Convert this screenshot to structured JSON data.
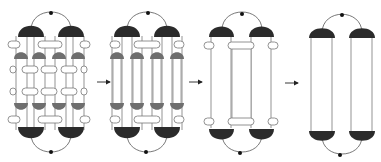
{
  "diagram": {
    "title": "",
    "colors": {
      "dark_cap": "#2b2b2b",
      "mid_cap": "#6e6e6e",
      "line": "#555555",
      "pill_stroke": "#777777",
      "pill_fill": "#ffffff",
      "dot": "#111111",
      "arrow": "#222222",
      "background": "#ffffff"
    },
    "panels": [
      {
        "id": "stage-1",
        "label": "",
        "description": "Two dark outer caps per end, four gray inner caps per row, multiple pill cross-links"
      },
      {
        "id": "stage-2",
        "label": "",
        "description": "Four long vertical columns with gray caps, pill links near ends"
      },
      {
        "id": "stage-3",
        "label": "",
        "description": "Three columns, dark caps, pill links near ends"
      },
      {
        "id": "stage-4",
        "label": "",
        "description": "Two long columns with dark caps, connected by arcs with dots"
      }
    ],
    "arrows": [
      {
        "from": "stage-1",
        "to": "stage-2"
      },
      {
        "from": "stage-2",
        "to": "stage-3"
      },
      {
        "from": "stage-3",
        "to": "stage-4"
      }
    ]
  }
}
